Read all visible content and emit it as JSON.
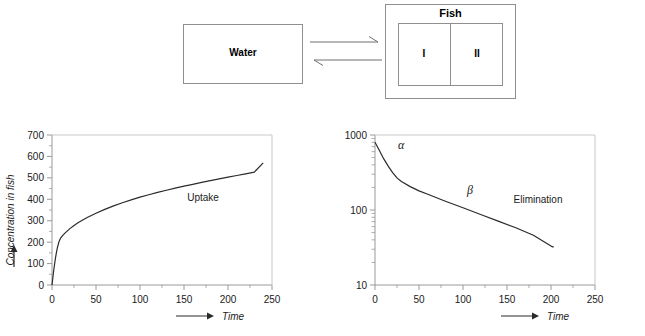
{
  "diagram": {
    "water_label": "Water",
    "fish_label": "Fish",
    "compartment_1_label": "I",
    "compartment_2_label": "II",
    "arrow_forward_name": "forward-arrow",
    "arrow_reverse_name": "reverse-arrow"
  },
  "chart_data": [
    {
      "type": "line",
      "title": "",
      "annotation": "Uptake",
      "xlabel": "Time",
      "ylabel": "Concentration in fish",
      "yscale": "linear",
      "xlim": [
        0,
        250
      ],
      "ylim": [
        0,
        700
      ],
      "xticks": [
        0,
        50,
        100,
        150,
        200,
        250
      ],
      "xtick_labels": [
        "0",
        "50",
        "100",
        "150",
        "200",
        "250"
      ],
      "yticks": [
        0,
        100,
        200,
        300,
        400,
        500,
        600,
        700
      ],
      "ytick_labels": [
        "0",
        "100",
        "200",
        "300",
        "400",
        "500",
        "600",
        "700"
      ],
      "grid": false,
      "legend": "none",
      "series": [
        {
          "name": "Uptake",
          "x": [
            0,
            2,
            4,
            6,
            8,
            10,
            12,
            15,
            20,
            25,
            30,
            40,
            50,
            60,
            70,
            80,
            90,
            100,
            110,
            120,
            130,
            140,
            150,
            160,
            170,
            180,
            190,
            200,
            210,
            220,
            230,
            240
          ],
          "y": [
            0,
            70,
            128,
            172,
            203,
            220,
            230,
            243,
            262,
            278,
            292,
            315,
            335,
            353,
            369,
            384,
            397,
            410,
            421,
            432,
            442,
            452,
            461,
            470,
            479,
            487,
            495,
            503,
            511,
            519,
            527,
            570
          ]
        }
      ]
    },
    {
      "type": "line",
      "title": "",
      "annotation": "Elimination",
      "annotation_alpha": "α",
      "annotation_beta": "β",
      "xlabel": "Time",
      "ylabel": "",
      "yscale": "log",
      "xlim": [
        0,
        250
      ],
      "ylim": [
        10,
        1000
      ],
      "xticks": [
        0,
        50,
        100,
        150,
        200,
        250
      ],
      "xtick_labels": [
        "0",
        "50",
        "100",
        "150",
        "200",
        "250"
      ],
      "yticks": [
        10,
        100,
        1000
      ],
      "ytick_labels": [
        "10",
        "100",
        "1000"
      ],
      "grid": false,
      "legend": "none",
      "series": [
        {
          "name": "Elimination",
          "x": [
            0,
            5,
            10,
            15,
            20,
            25,
            30,
            40,
            50,
            60,
            80,
            100,
            120,
            140,
            160,
            180,
            200,
            203
          ],
          "y": [
            800,
            620,
            480,
            385,
            315,
            268,
            240,
            205,
            180,
            162,
            131,
            107,
            87,
            71,
            58,
            46,
            33,
            32
          ]
        }
      ]
    }
  ],
  "colors": {
    "axis": "#9a9a9a",
    "curve": "#2b2b2b",
    "text": "#1a1a1a",
    "box_border": "#8f8f8f",
    "background": "#ffffff"
  }
}
